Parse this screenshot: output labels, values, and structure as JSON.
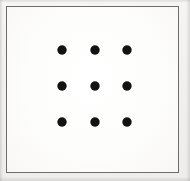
{
  "figure": {
    "name": "nine-dot-grid",
    "width": 190,
    "height": 181,
    "background_color": "#f3f2f0",
    "caption": ""
  },
  "frame": {
    "name": "bounding-rectangle",
    "x": 6,
    "y": 6,
    "width": 173,
    "height": 167,
    "border_color": "#6d6d6d",
    "border_width": 1,
    "fill_color": "#fcfcfb"
  },
  "chart_data": {
    "type": "scatter",
    "title": "",
    "subtitle": "",
    "xlabel": "",
    "ylabel": "",
    "grid": false,
    "legend": null,
    "legend_position": "none",
    "xlim": [
      0,
      190
    ],
    "ylim": [
      0,
      181
    ],
    "marker": {
      "shape": "circle",
      "diameter": 9,
      "color": "#121212"
    },
    "rows": 3,
    "columns": 3,
    "column_x": [
      62,
      95,
      127
    ],
    "row_y": [
      50,
      86,
      122
    ],
    "points": [
      {
        "id": "dot-r1-c1",
        "row": 1,
        "col": 1,
        "x": 62,
        "y": 50
      },
      {
        "id": "dot-r1-c2",
        "row": 1,
        "col": 2,
        "x": 95,
        "y": 50
      },
      {
        "id": "dot-r1-c3",
        "row": 1,
        "col": 3,
        "x": 127,
        "y": 50
      },
      {
        "id": "dot-r2-c1",
        "row": 2,
        "col": 1,
        "x": 62,
        "y": 86
      },
      {
        "id": "dot-r2-c2",
        "row": 2,
        "col": 2,
        "x": 95,
        "y": 86
      },
      {
        "id": "dot-r2-c3",
        "row": 2,
        "col": 3,
        "x": 127,
        "y": 86
      },
      {
        "id": "dot-r3-c1",
        "row": 3,
        "col": 1,
        "x": 62,
        "y": 122
      },
      {
        "id": "dot-r3-c2",
        "row": 3,
        "col": 2,
        "x": 95,
        "y": 122
      },
      {
        "id": "dot-r3-c3",
        "row": 3,
        "col": 3,
        "x": 127,
        "y": 122
      }
    ]
  }
}
